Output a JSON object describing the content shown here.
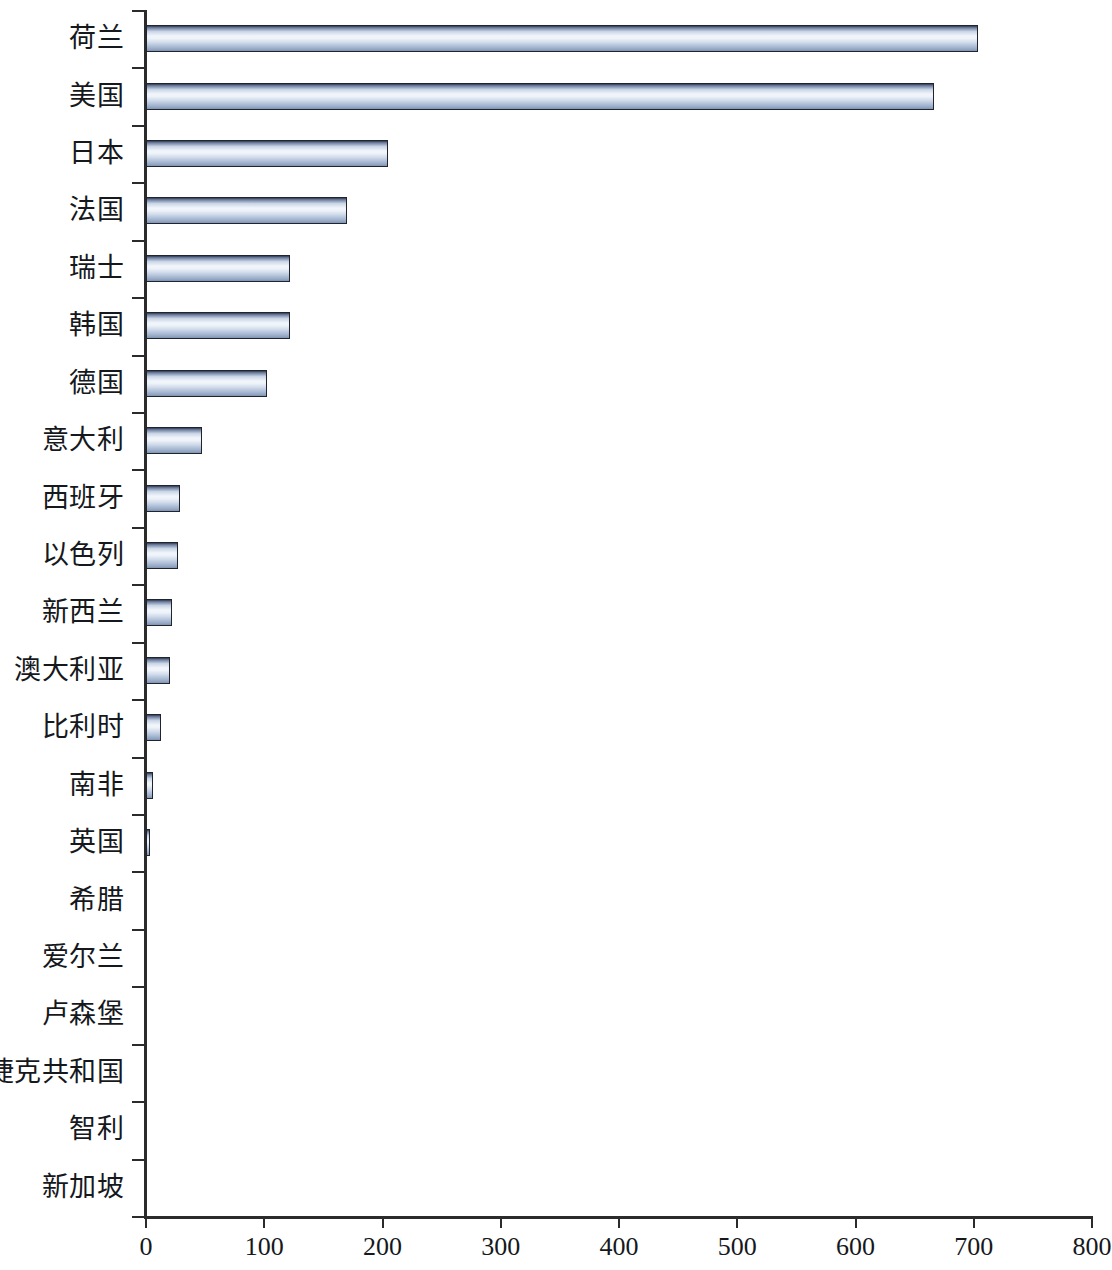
{
  "chart_data": {
    "type": "bar",
    "orientation": "horizontal",
    "title": "",
    "subtitle": "",
    "xlabel": "",
    "ylabel": "",
    "xlim": [
      0,
      800
    ],
    "ylim": null,
    "grid": false,
    "legend": null,
    "legend_position": "none",
    "x_ticks": [
      0,
      100,
      200,
      300,
      400,
      500,
      600,
      700,
      800
    ],
    "x_tick_labels": [
      "0",
      "100",
      "200",
      "300",
      "400",
      "500",
      "600",
      "700",
      "800"
    ],
    "categories": [
      "荷兰",
      "美国",
      "日本",
      "法国",
      "瑞士",
      "韩国",
      "德国",
      "意大利",
      "西班牙",
      "以色列",
      "新西兰",
      "澳大利亚",
      "比利时",
      "南非",
      "英国",
      "希腊",
      "爱尔兰",
      "卢森堡",
      "捷克共和国",
      "智利",
      "新加坡"
    ],
    "values": [
      704,
      666,
      205,
      170,
      122,
      122,
      102,
      47,
      29,
      27,
      22,
      20,
      13,
      6,
      3,
      0,
      0,
      0,
      0,
      0,
      0
    ],
    "series": [
      {
        "name": "",
        "values": [
          704,
          666,
          205,
          170,
          122,
          122,
          102,
          47,
          29,
          27,
          22,
          20,
          13,
          6,
          3,
          0,
          0,
          0,
          0,
          0,
          0
        ]
      }
    ],
    "colors": {
      "bar_highlight": "#f2f6fb",
      "bar_mid": "#cfdaea",
      "bar_shadow": "#7f92ae",
      "bar_border": "#20242e",
      "axis": "#2b2b2b",
      "text": "#15181c",
      "background": "#ffffff"
    }
  }
}
